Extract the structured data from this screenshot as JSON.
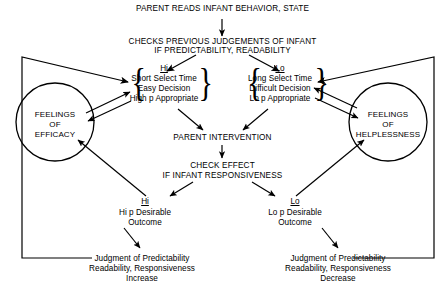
{
  "diagram": {
    "title_top": "PARENT READS INFANT BEHAVIOR, STATE",
    "checks_line1": "CHECKS PREVIOUS JUDGEMENTS OF INFANT",
    "checks_line2": "IF PREDICTABILITY, READABILITY",
    "hi_branch": {
      "header": "Hi",
      "line1": "Short Select Time",
      "line2": "Easy Decision",
      "line3": "High p Appropriate"
    },
    "lo_branch": {
      "header": "Lo",
      "line1": "Long Select Time",
      "line2": "Difficult Decision",
      "line3": "Lo p Appropriate"
    },
    "efficacy_circle": {
      "line1": "FEELINGS",
      "line2": "OF",
      "line3": "EFFICACY"
    },
    "helplessness_circle": {
      "line1": "FEELINGS",
      "line2": "OF",
      "line3": "HELPLESSNESS"
    },
    "intervention": "PARENT INTERVENTION",
    "check_effect_line1": "CHECK EFFECT",
    "check_effect_line2": "IF INFANT RESPONSIVENESS",
    "hi_outcome": {
      "header": "Hi",
      "line1": "Hi p Desirable",
      "line2": "Outcome"
    },
    "lo_outcome": {
      "header": "Lo",
      "line1": "Lo p Desirable",
      "line2": "Outcome"
    },
    "judgment_increase": {
      "line1": "Judgment of Predictability",
      "line2": "Readability, Responsiveness",
      "line3": "Increase"
    },
    "judgment_decrease": {
      "line1": "Judgment of Predictability",
      "line2": "Readability, Responsiveness",
      "line3": "Decrease"
    },
    "brace_open": "{",
    "brace_close": "}",
    "colors": {
      "stroke": "#000000",
      "background": "#ffffff",
      "text": "#000000"
    }
  }
}
